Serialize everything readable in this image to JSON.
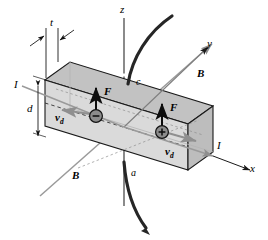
{
  "figure": {
    "kind": "hall-effect-diagram",
    "background_color": "#ffffff",
    "slab_face_color": "#d8d8d8",
    "slab_top_color": "#c2c2c2",
    "slab_end_color": "#bdbdbd",
    "outline_color": "#1a1a1a",
    "field_line_color": "#9a9a9a",
    "wire_color": "#2a2a2a",
    "carrier_fill_color": "#8c8c8c"
  },
  "axes": {
    "z_label": "z",
    "y_label": "y",
    "x_label": "x"
  },
  "dimensions": {
    "thickness_label": "t",
    "width_label": "d"
  },
  "current": {
    "label_left": "I",
    "label_right": "I"
  },
  "field": {
    "label_upper_right": "B",
    "label_lower_left": "B"
  },
  "terminals": {
    "top_label": "c",
    "bottom_label": "a"
  },
  "carriers": [
    {
      "name": "negative-carrier",
      "sign": "−",
      "force_label": "F",
      "velocity_label": "v",
      "velocity_subscript": "d",
      "velocity_direction": "left"
    },
    {
      "name": "positive-carrier",
      "sign": "+",
      "force_label": "F",
      "velocity_label": "v",
      "velocity_subscript": "d",
      "velocity_direction": "right"
    }
  ]
}
